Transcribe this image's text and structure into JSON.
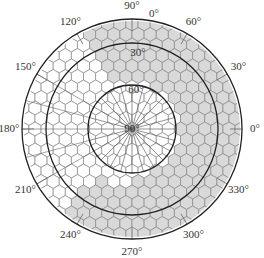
{
  "diagram": {
    "type": "polar-hexagonal-grid",
    "center": {
      "x": 132,
      "y": 129
    },
    "outer_radius": 110,
    "rings": [
      {
        "radius": 86,
        "label": "30°"
      },
      {
        "radius": 44,
        "label": "60°"
      }
    ],
    "center_label": "90°",
    "azimuth_labels": [
      {
        "angle": 90,
        "text": "90°"
      },
      {
        "angle": 60,
        "text": "60°"
      },
      {
        "angle": 30,
        "text": "30°"
      },
      {
        "angle": 0,
        "text": "0°"
      },
      {
        "angle": 330,
        "text": "330°"
      },
      {
        "angle": 300,
        "text": "300°"
      },
      {
        "angle": 270,
        "text": "270°"
      },
      {
        "angle": 240,
        "text": "240°"
      },
      {
        "angle": 210,
        "text": "210°"
      },
      {
        "angle": 180,
        "text": "180°"
      },
      {
        "angle": 150,
        "text": "150°"
      },
      {
        "angle": 120,
        "text": "120°"
      }
    ],
    "elevation_zero_label": "0°",
    "hex_size": 7,
    "colors": {
      "shaded_fill": "#d9d9d9",
      "unshaded_fill": "#ffffff",
      "hex_stroke": "#888888",
      "circle_stroke": "#222222",
      "spoke_stroke": "#666666"
    },
    "shaded_regions": [
      {
        "from_angle": -95,
        "to_angle": 115,
        "min_radius": 44,
        "note": "right side band"
      },
      {
        "from_angle": 232,
        "to_angle": 270,
        "min_radius": 58,
        "note": "lower-left lobe"
      },
      {
        "from_angle": 80,
        "to_angle": 120,
        "min_radius": 52,
        "note": "upper lobe"
      }
    ]
  }
}
